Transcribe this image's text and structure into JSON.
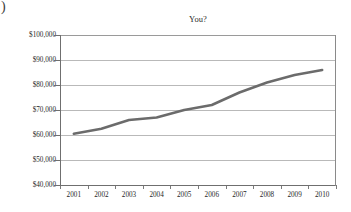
{
  "artifact": {
    "stray_glyph": ")"
  },
  "chart_data": {
    "type": "line",
    "title": "You?",
    "xlabel": "",
    "ylabel": "",
    "categories": [
      "2001",
      "2002",
      "2003",
      "2004",
      "2005",
      "2006",
      "2007",
      "2008",
      "2009",
      "2010"
    ],
    "values": [
      60500,
      62500,
      66000,
      67000,
      70000,
      72000,
      77000,
      81000,
      84000,
      86000
    ],
    "series": [
      {
        "name": "You?",
        "values": [
          60500,
          62500,
          66000,
          67000,
          70000,
          72000,
          77000,
          81000,
          84000,
          86000
        ]
      }
    ],
    "ylim": [
      40000,
      100000
    ],
    "ytick_values": [
      100000,
      90000,
      80000,
      70000,
      60000,
      50000,
      40000
    ],
    "ytick_labels": [
      "$100,000",
      "$90,000",
      "$80,000",
      "$70,000",
      "$60,000",
      "$50,000",
      "$40,000"
    ],
    "xtick_labels": [
      "2001",
      "2002",
      "2003",
      "2004",
      "2005",
      "2006",
      "2007",
      "2008",
      "2009",
      "2010"
    ],
    "grid": true,
    "grid_axis": "y",
    "legend": false,
    "legend_position": "none",
    "line_color": "#6b6b6b",
    "line_width": 2.5,
    "markers": false,
    "axis_color": "#6f6f6f",
    "grid_color": "#b9b9b9",
    "background_color": "#ffffff",
    "annotations": []
  }
}
